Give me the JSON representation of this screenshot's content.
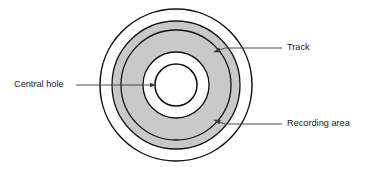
{
  "figure": {
    "name": "optical-disc-structure-diagram",
    "background_color": "#ffffff",
    "width": 377,
    "height": 171
  },
  "disc": {
    "center_x": 176,
    "center_y": 85,
    "outline_color": "#111111",
    "band_fill_color": "#c9c9c9",
    "hole_fill_color": "#ffffff",
    "rings": [
      {
        "name": "outer-edge",
        "radius": 76,
        "fill": "#ffffff",
        "stroke": "#111111"
      },
      {
        "name": "recording-area-outer-edge",
        "radius": 64,
        "fill": "#c9c9c9",
        "stroke": "#111111"
      },
      {
        "name": "track-circle",
        "radius": 55,
        "fill": "#c9c9c9",
        "stroke": "#111111"
      },
      {
        "name": "recording-area-inner-edge",
        "radius": 33,
        "fill": "#ffffff",
        "stroke": "#111111"
      },
      {
        "name": "central-hole",
        "radius": 21,
        "fill": "#ffffff",
        "stroke": "#111111"
      }
    ]
  },
  "annotations": [
    {
      "id": "track",
      "label": "Track",
      "text_x": 287,
      "text_y": 48,
      "leader": {
        "x1": 282,
        "y1": 48,
        "x2": 222,
        "y2": 48
      },
      "arrow": {
        "tip_x": 216,
        "tip_y": 51,
        "angle": 205
      }
    },
    {
      "id": "recording-area",
      "label": "Recording area",
      "text_x": 287,
      "text_y": 124,
      "leader": {
        "x1": 282,
        "y1": 124,
        "x2": 222,
        "y2": 124
      },
      "arrow": {
        "tip_x": 216,
        "tip_y": 121,
        "angle": 155
      }
    },
    {
      "id": "central-hole",
      "label": "Central hole",
      "text_x": 14,
      "text_y": 85,
      "leader": {
        "x1": 75,
        "y1": 85,
        "x2": 152,
        "y2": 85
      },
      "arrow": {
        "tip_x": 158,
        "tip_y": 85,
        "angle": 0
      }
    }
  ]
}
